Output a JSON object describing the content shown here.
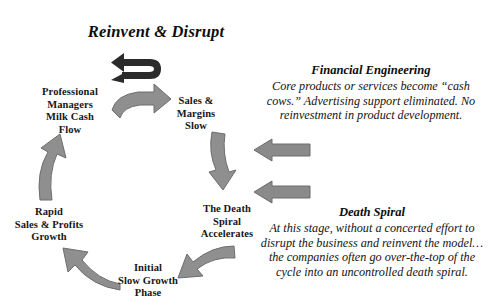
{
  "title": "Reinvent & Disrupt",
  "cycle": {
    "nodes": [
      {
        "id": "professional",
        "lines": [
          "Professional",
          "Managers",
          "Milk Cash",
          "Flow"
        ]
      },
      {
        "id": "sales",
        "lines": [
          "Sales &",
          "Margins",
          "Slow"
        ]
      },
      {
        "id": "death",
        "lines": [
          "The Death",
          "Spiral",
          "Accelerates"
        ]
      },
      {
        "id": "initial",
        "lines": [
          "Initial",
          "Slow Growth",
          "Phase"
        ]
      },
      {
        "id": "rapid",
        "lines": [
          "Rapid",
          "Sales & Profits",
          "Growth"
        ]
      }
    ]
  },
  "annotations": [
    {
      "id": "financial",
      "heading": "Financial Engineering",
      "body": "Core products or services become “cash cows.”   Advertising support eliminated. No reinvestment in product development."
    },
    {
      "id": "death",
      "heading": "Death Spiral",
      "body": "At this stage, without a concerted effort to disrupt the business and reinvent the model…the companies often go over-the-top of the cycle into an uncontrolled death spiral."
    }
  ],
  "arrows": [
    {
      "id": "reinvent-loop",
      "label": "u-turn-arrow-left",
      "color": "#2b2b2b"
    },
    {
      "id": "professional-to-sales",
      "label": "curved-arrow-right",
      "color": "#8f8f8f"
    },
    {
      "id": "sales-to-death",
      "label": "curved-arrow-down",
      "color": "#8f8f8f"
    },
    {
      "id": "death-to-initial",
      "label": "curved-arrow-down-left",
      "color": "#8f8f8f"
    },
    {
      "id": "initial-to-rapid",
      "label": "curved-arrow-up-left",
      "color": "#8f8f8f"
    },
    {
      "id": "rapid-to-professional",
      "label": "curved-arrow-up",
      "color": "#8f8f8f"
    },
    {
      "id": "pointer-financial",
      "label": "straight-arrow-left",
      "color": "#8a8a8a"
    },
    {
      "id": "pointer-death",
      "label": "straight-arrow-left",
      "color": "#8a8a8a"
    }
  ],
  "colors": {
    "arrow_gray": "#8f8f8f",
    "arrow_dark": "#2b2b2b",
    "text": "#161616",
    "background": "#ffffff"
  }
}
